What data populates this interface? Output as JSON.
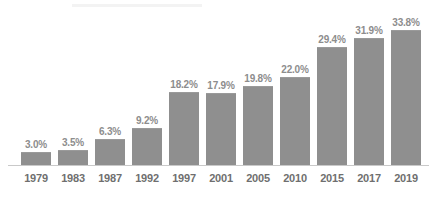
{
  "chart_data": {
    "type": "bar",
    "title": "",
    "subtitle": "",
    "xlabel": "",
    "ylabel": "",
    "ylim": [
      0,
      33.8
    ],
    "grid": false,
    "legend": "none",
    "orientation": "vertical",
    "value_label_suffix": "%",
    "bar_color": "#8f8f8f",
    "label_color": "#8d8d8d",
    "axis_label_color": "#6f6f6f",
    "axis_line_color": "#c9c9c9",
    "background_color": "#ffffff",
    "categories": [
      "1979",
      "1983",
      "1987",
      "1992",
      "1997",
      "2001",
      "2005",
      "2010",
      "2015",
      "2017",
      "2019"
    ],
    "values": [
      3.0,
      3.5,
      6.3,
      9.2,
      18.2,
      17.9,
      19.8,
      22.0,
      29.4,
      31.9,
      33.8
    ],
    "value_labels": [
      "3.0%",
      "3.5%",
      "6.3%",
      "9.2%",
      "18.2%",
      "17.9%",
      "19.8%",
      "22.0%",
      "29.4%",
      "31.9%",
      "33.8%"
    ],
    "points": [
      {
        "category": "1979",
        "value": 3.0,
        "label": "3.0%"
      },
      {
        "category": "1983",
        "value": 3.5,
        "label": "3.5%"
      },
      {
        "category": "1987",
        "value": 6.3,
        "label": "6.3%"
      },
      {
        "category": "1992",
        "value": 9.2,
        "label": "9.2%"
      },
      {
        "category": "1997",
        "value": 18.2,
        "label": "18.2%"
      },
      {
        "category": "2001",
        "value": 17.9,
        "label": "17.9%"
      },
      {
        "category": "2005",
        "value": 19.8,
        "label": "19.8%"
      },
      {
        "category": "2010",
        "value": 22.0,
        "label": "22.0%"
      },
      {
        "category": "2015",
        "value": 29.4,
        "label": "29.4%"
      },
      {
        "category": "2017",
        "value": 31.9,
        "label": "31.9%"
      },
      {
        "category": "2019",
        "value": 33.8,
        "label": "33.8%"
      }
    ]
  }
}
